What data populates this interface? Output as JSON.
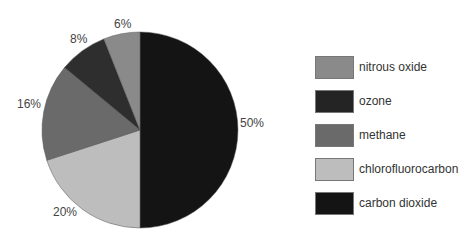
{
  "chart_data": {
    "type": "pie",
    "title": "",
    "categories": [
      "carbon dioxide",
      "chlorofluorocarbon",
      "methane",
      "ozone",
      "nitrous oxide"
    ],
    "values": [
      50,
      20,
      16,
      8,
      6
    ],
    "labels": [
      "50%",
      "20%",
      "16%",
      "8%",
      "6%"
    ],
    "colors": [
      "#141414",
      "#bdbdbd",
      "#6a6a6a",
      "#2e2e2e",
      "#8a8a8a"
    ],
    "start_angle": "12 o'clock, clockwise",
    "legend_position": "right"
  },
  "legend": {
    "items": [
      {
        "label": "nitrous oxide",
        "color": "#8a8a8a"
      },
      {
        "label": "ozone",
        "color": "#242424"
      },
      {
        "label": "methane",
        "color": "#6a6a6a"
      },
      {
        "label": "chlorofluorocarbon",
        "color": "#bdbdbd"
      },
      {
        "label": "carbon dioxide",
        "color": "#141414"
      }
    ]
  }
}
